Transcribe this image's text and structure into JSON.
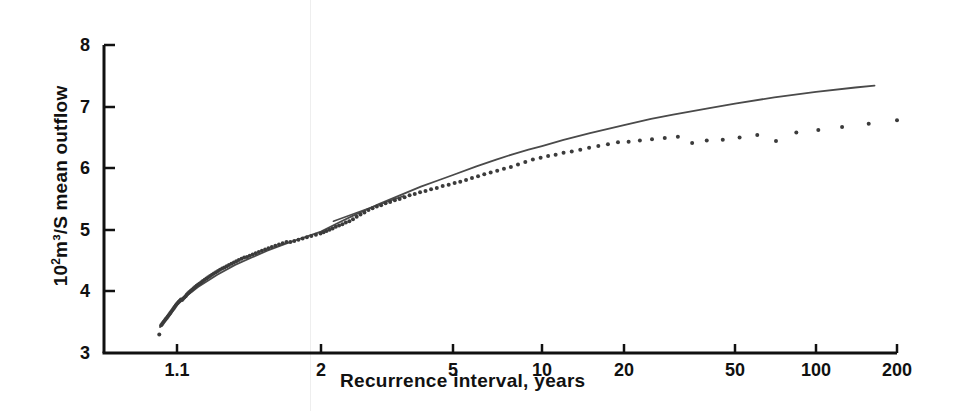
{
  "chart_data": {
    "type": "scatter",
    "title": "",
    "subtitle": "",
    "xlabel": "Recurrence interval, years",
    "ylabel": "10²m³/S  mean outflow",
    "ylabel_prefix": "10",
    "ylabel_exponent": "2",
    "ylabel_rest": "m³/S  mean outflow",
    "xscale": "gumbel-log",
    "yscale": "linear",
    "xlim": [
      1.02,
      200
    ],
    "ylim": [
      3,
      8
    ],
    "grid": false,
    "legend": null,
    "legend_position": "none",
    "xticks": [
      {
        "label": "1.1",
        "value": 1.1,
        "px": 177
      },
      {
        "label": "2",
        "value": 2,
        "px": 321
      },
      {
        "label": "5",
        "value": 5,
        "px": 453
      },
      {
        "label": "10",
        "value": 10,
        "px": 542
      },
      {
        "label": "20",
        "value": 20,
        "px": 624
      },
      {
        "label": "50",
        "value": 50,
        "px": 735
      },
      {
        "label": "100",
        "value": 100,
        "px": 816
      },
      {
        "label": "200",
        "value": 200,
        "px": 897
      }
    ],
    "yticks": [
      {
        "label": "3",
        "value": 3,
        "px": 353
      },
      {
        "label": "4",
        "value": 4,
        "px": 291
      },
      {
        "label": "5",
        "value": 5,
        "px": 230
      },
      {
        "label": "6",
        "value": 6,
        "px": 168
      },
      {
        "label": "7",
        "value": 7,
        "px": 107
      },
      {
        "label": "8",
        "value": 8,
        "px": 45
      }
    ],
    "axis_box": {
      "left": 104,
      "right": 897,
      "top": 45,
      "bottom": 353
    },
    "series": [
      {
        "name": "observations",
        "type": "scatter",
        "marker": "dot",
        "color": "#3b3b3b",
        "points": [
          [
            1.022,
            3.3
          ],
          [
            1.03,
            3.45
          ],
          [
            1.034,
            3.47
          ],
          [
            1.038,
            3.49
          ],
          [
            1.042,
            3.51
          ],
          [
            1.046,
            3.53
          ],
          [
            1.05,
            3.55
          ],
          [
            1.054,
            3.57
          ],
          [
            1.058,
            3.59
          ],
          [
            1.062,
            3.61
          ],
          [
            1.066,
            3.63
          ],
          [
            1.07,
            3.65
          ],
          [
            1.074,
            3.67
          ],
          [
            1.078,
            3.69
          ],
          [
            1.082,
            3.71
          ],
          [
            1.086,
            3.73
          ],
          [
            1.09,
            3.75
          ],
          [
            1.094,
            3.77
          ],
          [
            1.098,
            3.79
          ],
          [
            1.103,
            3.81
          ],
          [
            1.108,
            3.83
          ],
          [
            1.113,
            3.85
          ],
          [
            1.118,
            3.87
          ],
          [
            1.123,
            3.86
          ],
          [
            1.128,
            3.88
          ],
          [
            1.134,
            3.9
          ],
          [
            1.14,
            3.92
          ],
          [
            1.146,
            3.95
          ],
          [
            1.152,
            3.97
          ],
          [
            1.158,
            3.99
          ],
          [
            1.165,
            4.01
          ],
          [
            1.172,
            4.03
          ],
          [
            1.179,
            4.05
          ],
          [
            1.186,
            4.07
          ],
          [
            1.193,
            4.09
          ],
          [
            1.201,
            4.11
          ],
          [
            1.209,
            4.13
          ],
          [
            1.217,
            4.15
          ],
          [
            1.225,
            4.17
          ],
          [
            1.234,
            4.19
          ],
          [
            1.243,
            4.21
          ],
          [
            1.252,
            4.23
          ],
          [
            1.262,
            4.25
          ],
          [
            1.272,
            4.27
          ],
          [
            1.282,
            4.29
          ],
          [
            1.293,
            4.31
          ],
          [
            1.304,
            4.33
          ],
          [
            1.315,
            4.35
          ],
          [
            1.327,
            4.37
          ],
          [
            1.339,
            4.39
          ],
          [
            1.352,
            4.41
          ],
          [
            1.365,
            4.43
          ],
          [
            1.379,
            4.45
          ],
          [
            1.393,
            4.47
          ],
          [
            1.407,
            4.49
          ],
          [
            1.422,
            4.51
          ],
          [
            1.438,
            4.53
          ],
          [
            1.454,
            4.55
          ],
          [
            1.471,
            4.56
          ],
          [
            1.488,
            4.58
          ],
          [
            1.506,
            4.6
          ],
          [
            1.525,
            4.62
          ],
          [
            1.545,
            4.64
          ],
          [
            1.565,
            4.66
          ],
          [
            1.586,
            4.68
          ],
          [
            1.608,
            4.7
          ],
          [
            1.631,
            4.72
          ],
          [
            1.655,
            4.74
          ],
          [
            1.68,
            4.76
          ],
          [
            1.706,
            4.78
          ],
          [
            1.733,
            4.8
          ],
          [
            1.761,
            4.8
          ],
          [
            1.79,
            4.82
          ],
          [
            1.821,
            4.84
          ],
          [
            1.853,
            4.86
          ],
          [
            1.886,
            4.88
          ],
          [
            1.921,
            4.9
          ],
          [
            1.958,
            4.92
          ],
          [
            1.996,
            4.94
          ],
          [
            2.036,
            4.96
          ],
          [
            2.078,
            4.98
          ],
          [
            2.122,
            5.0
          ],
          [
            2.168,
            5.02
          ],
          [
            2.216,
            5.05
          ],
          [
            2.267,
            5.07
          ],
          [
            2.32,
            5.09
          ],
          [
            2.376,
            5.12
          ],
          [
            2.435,
            5.14
          ],
          [
            2.497,
            5.17
          ],
          [
            2.562,
            5.21
          ],
          [
            2.631,
            5.25
          ],
          [
            2.703,
            5.28
          ],
          [
            2.78,
            5.32
          ],
          [
            2.861,
            5.35
          ],
          [
            2.946,
            5.38
          ],
          [
            3.036,
            5.4
          ],
          [
            3.131,
            5.43
          ],
          [
            3.232,
            5.45
          ],
          [
            3.339,
            5.48
          ],
          [
            3.452,
            5.5
          ],
          [
            3.572,
            5.53
          ],
          [
            3.699,
            5.56
          ],
          [
            3.834,
            5.58
          ],
          [
            3.978,
            5.61
          ],
          [
            4.131,
            5.63
          ],
          [
            4.294,
            5.66
          ],
          [
            4.468,
            5.68
          ],
          [
            4.654,
            5.71
          ],
          [
            4.852,
            5.73
          ],
          [
            5.064,
            5.76
          ],
          [
            5.291,
            5.78
          ],
          [
            5.535,
            5.81
          ],
          [
            5.796,
            5.84
          ],
          [
            6.077,
            5.87
          ],
          [
            6.379,
            5.9
          ],
          [
            6.704,
            5.93
          ],
          [
            7.055,
            5.96
          ],
          [
            7.435,
            5.99
          ],
          [
            7.847,
            6.02
          ],
          [
            8.294,
            6.06
          ],
          [
            8.781,
            6.1
          ],
          [
            9.312,
            6.14
          ],
          [
            9.892,
            6.17
          ],
          [
            10.53,
            6.2
          ],
          [
            11.22,
            6.22
          ],
          [
            12.0,
            6.25
          ],
          [
            12.86,
            6.27
          ],
          [
            13.82,
            6.3
          ],
          [
            14.89,
            6.33
          ],
          [
            16.1,
            6.36
          ],
          [
            17.46,
            6.39
          ],
          [
            19.01,
            6.42
          ],
          [
            20.78,
            6.43
          ],
          [
            22.8,
            6.45
          ],
          [
            25.2,
            6.47
          ],
          [
            28.0,
            6.49
          ],
          [
            31.2,
            6.51
          ],
          [
            35.1,
            6.41
          ],
          [
            39.6,
            6.45
          ],
          [
            45.2,
            6.46
          ],
          [
            52.0,
            6.5
          ],
          [
            60.5,
            6.54
          ],
          [
            71.0,
            6.44
          ],
          [
            84.5,
            6.58
          ],
          [
            102.0,
            6.62
          ],
          [
            125.0,
            6.67
          ],
          [
            157.0,
            6.72
          ],
          [
            200.0,
            6.78
          ]
        ]
      },
      {
        "name": "fitted-curve",
        "type": "line",
        "color": "#4a4a4a",
        "points": [
          [
            1.025,
            3.42
          ],
          [
            1.05,
            3.55
          ],
          [
            1.1,
            3.78
          ],
          [
            1.15,
            3.94
          ],
          [
            1.2,
            4.07
          ],
          [
            1.3,
            4.27
          ],
          [
            1.4,
            4.43
          ],
          [
            1.5,
            4.55
          ],
          [
            1.6,
            4.66
          ],
          [
            1.7,
            4.75
          ],
          [
            1.8,
            4.83
          ],
          [
            1.9,
            4.9
          ],
          [
            2.0,
            4.97
          ],
          [
            2.25,
            5.11
          ],
          [
            2.5,
            5.23
          ],
          [
            2.75,
            5.33
          ],
          [
            3.0,
            5.42
          ],
          [
            3.5,
            5.57
          ],
          [
            4.0,
            5.7
          ],
          [
            4.5,
            5.8
          ],
          [
            5.0,
            5.89
          ],
          [
            6.0,
            6.03
          ],
          [
            7.0,
            6.14
          ],
          [
            8.0,
            6.23
          ],
          [
            9.0,
            6.3
          ],
          [
            10.0,
            6.36
          ],
          [
            12.0,
            6.46
          ],
          [
            15.0,
            6.57
          ],
          [
            20.0,
            6.7
          ],
          [
            25.0,
            6.8
          ],
          [
            30.0,
            6.87
          ],
          [
            40.0,
            6.97
          ],
          [
            50.0,
            7.05
          ],
          [
            70.0,
            7.15
          ],
          [
            100.0,
            7.24
          ],
          [
            140.0,
            7.31
          ],
          [
            165.0,
            7.34
          ]
        ]
      },
      {
        "name": "secondary-segment",
        "type": "line",
        "color": "#4a4a4a",
        "points": [
          [
            2.18,
            5.14
          ],
          [
            2.6,
            5.29
          ],
          [
            3.1,
            5.44
          ],
          [
            3.55,
            5.55
          ]
        ]
      }
    ]
  },
  "axes": {
    "x_axis_name": "recurrence-interval-axis",
    "y_axis_name": "mean-outflow-axis"
  }
}
